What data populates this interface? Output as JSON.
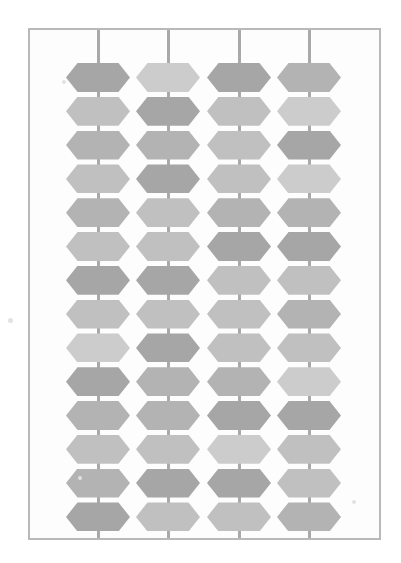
{
  "canvas": {
    "width": 401,
    "height": 563,
    "background": "#ffffff"
  },
  "frame": {
    "label": "pattern-frame",
    "x": 28,
    "y": 28,
    "width": 353,
    "height": 512,
    "border_color": "#b9b9b9",
    "border_width": 2,
    "fill": "#fdfdfd"
  },
  "grid_lines": {
    "label": "vertical-grid-lines",
    "color": "#a9a9a9",
    "width": 3,
    "x_positions": [
      98,
      168,
      239,
      309
    ]
  },
  "hex_pattern": {
    "label": "hexagon-lattice",
    "columns": 4,
    "rows": 14,
    "hex_width": 64,
    "hex_height": 29,
    "row_pitch": 33.8,
    "first_row_top": 63,
    "palette": {
      "light": "#cccccc",
      "mid_light": "#c0c0c0",
      "mid": "#b3b3b3",
      "mid_dark": "#a6a6a6",
      "dark": "#9a9a9a"
    },
    "shades": [
      [
        "mid_dark",
        "light",
        "mid_dark",
        "mid"
      ],
      [
        "mid_light",
        "mid_dark",
        "mid_light",
        "light"
      ],
      [
        "mid",
        "mid",
        "mid_light",
        "mid_dark"
      ],
      [
        "mid_light",
        "mid_dark",
        "mid_light",
        "light"
      ],
      [
        "mid",
        "mid_light",
        "mid",
        "mid"
      ],
      [
        "mid_light",
        "mid_light",
        "mid_dark",
        "mid_dark"
      ],
      [
        "mid_dark",
        "mid_dark",
        "mid_light",
        "mid_light"
      ],
      [
        "mid_light",
        "mid_light",
        "mid_light",
        "mid"
      ],
      [
        "light",
        "mid_dark",
        "mid_light",
        "mid_light"
      ],
      [
        "mid_dark",
        "mid",
        "mid",
        "light"
      ],
      [
        "mid",
        "mid",
        "mid_dark",
        "mid_dark"
      ],
      [
        "mid_light",
        "mid_light",
        "light",
        "mid_light"
      ],
      [
        "mid",
        "mid_dark",
        "mid_dark",
        "mid_light"
      ],
      [
        "mid_dark",
        "mid_light",
        "mid_light",
        "mid"
      ]
    ]
  },
  "specks": [
    {
      "x": 8,
      "y": 318,
      "size": 5
    },
    {
      "x": 62,
      "y": 80,
      "size": 4
    },
    {
      "x": 352,
      "y": 500,
      "size": 4
    },
    {
      "x": 78,
      "y": 476,
      "size": 4
    }
  ]
}
